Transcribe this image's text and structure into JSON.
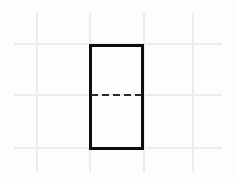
{
  "drawing": {
    "title": "Rectangle with horizontal centerline on graph paper",
    "canvas": {
      "width": 237,
      "height": 179,
      "background_color": "#fdfdfd"
    },
    "grid": {
      "color": "#ececec",
      "line_width": 2,
      "vertical_lines": [
        {
          "name": "grid-line-v-1",
          "x": 36,
          "y_start": 13,
          "y_end": 172
        },
        {
          "name": "grid-line-v-2",
          "x": 89,
          "y_start": 13,
          "y_end": 172
        },
        {
          "name": "grid-line-v-3",
          "x": 143,
          "y_start": 13,
          "y_end": 172
        },
        {
          "name": "grid-line-v-4",
          "x": 192,
          "y_start": 13,
          "y_end": 172
        }
      ],
      "horizontal_lines": [
        {
          "name": "grid-line-h-1",
          "y": 43,
          "x_start": 14,
          "x_end": 222
        },
        {
          "name": "grid-line-h-2",
          "y": 94,
          "x_start": 14,
          "x_end": 222
        },
        {
          "name": "grid-line-h-3",
          "y": 147,
          "x_start": 14,
          "x_end": 222
        }
      ]
    },
    "shapes": [
      {
        "name": "rectangle-outline",
        "type": "rectangle",
        "stroke_color": "#0d0d0d",
        "stroke_width": 3,
        "fill": "none",
        "left": 89,
        "top": 44,
        "width": 55,
        "height": 106
      },
      {
        "name": "horizontal-centerline",
        "type": "dashed-line",
        "stroke_color": "#2a2a2a",
        "stroke_width": 2,
        "dash_length": 7,
        "gap_length": 4,
        "left": 91,
        "top": 94,
        "length": 51
      }
    ]
  }
}
